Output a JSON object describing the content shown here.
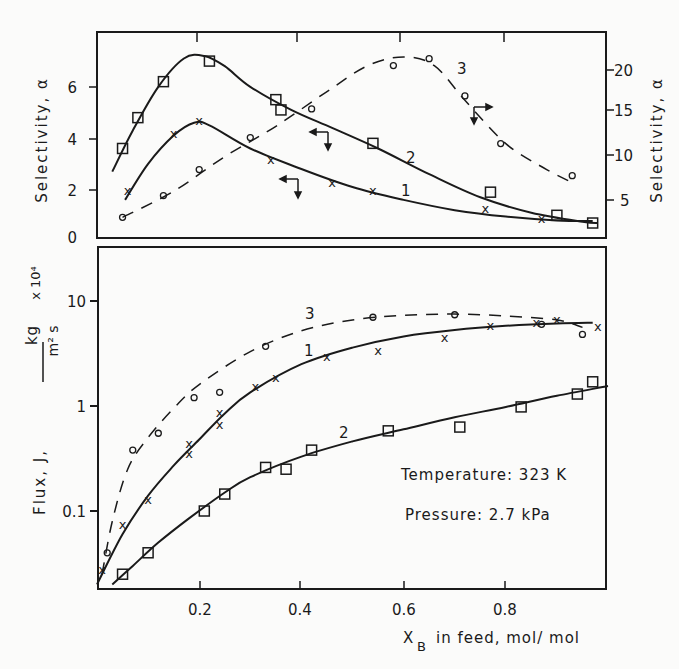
{
  "figure": {
    "top_panel": {
      "left_ylabel": "Selectivity, α",
      "right_ylabel": "Selectivity, α",
      "left_yticks": [
        "0",
        "2",
        "4",
        "6"
      ],
      "right_yticks": [
        "5",
        "10",
        "15",
        "20"
      ]
    },
    "bottom_panel": {
      "ylabel_prefix": "Flux, J,",
      "ylabel_unit_num": "kg",
      "ylabel_unit_den": "m² s",
      "ylabel_multiplier": "x 10⁴",
      "yticks": [
        "10",
        "1",
        "0.1"
      ],
      "xticks": [
        "0.2",
        "0.4",
        "0.6",
        "0.8"
      ],
      "xlabel": "X_B in feed, mol/mol",
      "annotation_temperature": "Temperature: 323 K",
      "annotation_pressure": "Pressure: 2.7 kPa"
    },
    "curve_labels": {
      "c1": "1",
      "c2": "2",
      "c3": "3"
    }
  },
  "chart_data": [
    {
      "type": "line",
      "title": "Selectivity vs feed composition",
      "xlabel": "X_B in feed, mol/mol",
      "ylabel": "Selectivity, α (left axis: curves 1,2; right axis: curve 3)",
      "xlim": [
        0,
        1.0
      ],
      "ylim_left": [
        0,
        8
      ],
      "ylim_right": [
        2.5,
        23
      ],
      "grid": false,
      "series": [
        {
          "name": "1",
          "axis": "left",
          "marker": "x",
          "line": "solid",
          "points": [
            [
              0.06,
              2.0
            ],
            [
              0.15,
              4.2
            ],
            [
              0.2,
              4.7
            ],
            [
              0.34,
              3.2
            ],
            [
              0.46,
              2.3
            ],
            [
              0.54,
              2.0
            ],
            [
              0.76,
              1.3
            ],
            [
              0.87,
              0.9
            ]
          ],
          "fit": [
            [
              0.055,
              1.6
            ],
            [
              0.1,
              3.0
            ],
            [
              0.15,
              4.1
            ],
            [
              0.19,
              4.6
            ],
            [
              0.22,
              4.5
            ],
            [
              0.3,
              3.6
            ],
            [
              0.4,
              2.8
            ],
            [
              0.5,
              2.1
            ],
            [
              0.6,
              1.6
            ],
            [
              0.7,
              1.2
            ],
            [
              0.8,
              0.95
            ],
            [
              0.9,
              0.8
            ],
            [
              0.97,
              0.78
            ]
          ]
        },
        {
          "name": "2",
          "axis": "left",
          "marker": "square",
          "line": "solid",
          "points": [
            [
              0.05,
              3.6
            ],
            [
              0.08,
              4.8
            ],
            [
              0.13,
              6.2
            ],
            [
              0.22,
              7.0
            ],
            [
              0.35,
              5.5
            ],
            [
              0.36,
              5.1
            ],
            [
              0.54,
              3.8
            ],
            [
              0.77,
              1.9
            ],
            [
              0.9,
              1.0
            ],
            [
              0.97,
              0.7
            ]
          ],
          "fit": [
            [
              0.03,
              2.7
            ],
            [
              0.07,
              4.3
            ],
            [
              0.12,
              6.0
            ],
            [
              0.17,
              7.1
            ],
            [
              0.21,
              7.2
            ],
            [
              0.25,
              6.8
            ],
            [
              0.3,
              6.0
            ],
            [
              0.38,
              5.1
            ],
            [
              0.46,
              4.4
            ],
            [
              0.55,
              3.6
            ],
            [
              0.65,
              2.6
            ],
            [
              0.75,
              1.7
            ],
            [
              0.85,
              1.1
            ],
            [
              0.95,
              0.75
            ],
            [
              0.98,
              0.7
            ]
          ]
        },
        {
          "name": "3",
          "axis": "right",
          "marker": "circle",
          "line": "dashed",
          "points": [
            [
              0.05,
              3.0
            ],
            [
              0.13,
              5.5
            ],
            [
              0.2,
              8.5
            ],
            [
              0.3,
              12.2
            ],
            [
              0.42,
              15.5
            ],
            [
              0.58,
              20.5
            ],
            [
              0.65,
              21.3
            ],
            [
              0.72,
              17.0
            ],
            [
              0.79,
              11.5
            ],
            [
              0.93,
              7.8
            ]
          ],
          "fit": [
            [
              0.05,
              3.0
            ],
            [
              0.15,
              6.0
            ],
            [
              0.25,
              10.0
            ],
            [
              0.35,
              13.5
            ],
            [
              0.45,
              17.5
            ],
            [
              0.53,
              20.5
            ],
            [
              0.6,
              21.5
            ],
            [
              0.66,
              20.5
            ],
            [
              0.72,
              16.5
            ],
            [
              0.8,
              11.5
            ],
            [
              0.88,
              8.5
            ],
            [
              0.93,
              7.0
            ]
          ]
        }
      ]
    },
    {
      "type": "line",
      "title": "Flux vs feed composition",
      "xlabel": "X_B in feed, mol/mol",
      "ylabel": "Flux, J, kg/(m² s) x 10⁴",
      "yscale": "log",
      "xlim": [
        0,
        1.0
      ],
      "ylim": [
        0.02,
        30
      ],
      "grid": false,
      "annotations": [
        "Temperature: 323 K",
        "Pressure: 2.7 kPa"
      ],
      "series": [
        {
          "name": "1",
          "marker": "x",
          "line": "solid",
          "points": [
            [
              0.01,
              0.028
            ],
            [
              0.05,
              0.075
            ],
            [
              0.1,
              0.13
            ],
            [
              0.18,
              0.36
            ],
            [
              0.18,
              0.44
            ],
            [
              0.24,
              0.68
            ],
            [
              0.24,
              0.88
            ],
            [
              0.31,
              1.55
            ],
            [
              0.35,
              1.9
            ],
            [
              0.45,
              3.0
            ],
            [
              0.55,
              3.4
            ],
            [
              0.68,
              4.5
            ],
            [
              0.77,
              5.9
            ],
            [
              0.86,
              6.3
            ],
            [
              0.9,
              6.7
            ],
            [
              0.98,
              5.8
            ]
          ],
          "fit": [
            [
              0.0,
              0.02
            ],
            [
              0.05,
              0.06
            ],
            [
              0.1,
              0.14
            ],
            [
              0.15,
              0.27
            ],
            [
              0.2,
              0.48
            ],
            [
              0.25,
              0.85
            ],
            [
              0.3,
              1.35
            ],
            [
              0.4,
              2.5
            ],
            [
              0.5,
              3.6
            ],
            [
              0.6,
              4.6
            ],
            [
              0.7,
              5.3
            ],
            [
              0.8,
              5.8
            ],
            [
              0.9,
              6.1
            ],
            [
              0.97,
              6.2
            ]
          ]
        },
        {
          "name": "2",
          "marker": "square",
          "line": "solid",
          "points": [
            [
              0.05,
              0.025
            ],
            [
              0.1,
              0.04
            ],
            [
              0.21,
              0.1
            ],
            [
              0.25,
              0.145
            ],
            [
              0.33,
              0.26
            ],
            [
              0.37,
              0.25
            ],
            [
              0.42,
              0.38
            ],
            [
              0.57,
              0.58
            ],
            [
              0.71,
              0.63
            ],
            [
              0.83,
              0.98
            ],
            [
              0.94,
              1.3
            ],
            [
              0.97,
              1.7
            ]
          ],
          "fit": [
            [
              0.03,
              0.02
            ],
            [
              0.07,
              0.03
            ],
            [
              0.12,
              0.05
            ],
            [
              0.18,
              0.085
            ],
            [
              0.25,
              0.15
            ],
            [
              0.3,
              0.21
            ],
            [
              0.4,
              0.33
            ],
            [
              0.5,
              0.46
            ],
            [
              0.6,
              0.6
            ],
            [
              0.7,
              0.78
            ],
            [
              0.8,
              0.98
            ],
            [
              0.9,
              1.25
            ],
            [
              1.0,
              1.55
            ]
          ]
        },
        {
          "name": "3",
          "marker": "circle",
          "line": "dashed",
          "points": [
            [
              0.02,
              0.04
            ],
            [
              0.07,
              0.38
            ],
            [
              0.12,
              0.55
            ],
            [
              0.19,
              1.2
            ],
            [
              0.24,
              1.35
            ],
            [
              0.33,
              3.7
            ],
            [
              0.54,
              7.0
            ],
            [
              0.7,
              7.4
            ],
            [
              0.87,
              6.0
            ],
            [
              0.95,
              4.8
            ]
          ],
          "fit": [
            [
              0.01,
              0.025
            ],
            [
              0.03,
              0.08
            ],
            [
              0.06,
              0.25
            ],
            [
              0.1,
              0.5
            ],
            [
              0.15,
              0.95
            ],
            [
              0.2,
              1.6
            ],
            [
              0.3,
              3.3
            ],
            [
              0.4,
              5.2
            ],
            [
              0.5,
              6.6
            ],
            [
              0.6,
              7.3
            ],
            [
              0.7,
              7.5
            ],
            [
              0.8,
              7.2
            ],
            [
              0.9,
              6.6
            ],
            [
              0.95,
              5.6
            ]
          ]
        }
      ]
    }
  ]
}
